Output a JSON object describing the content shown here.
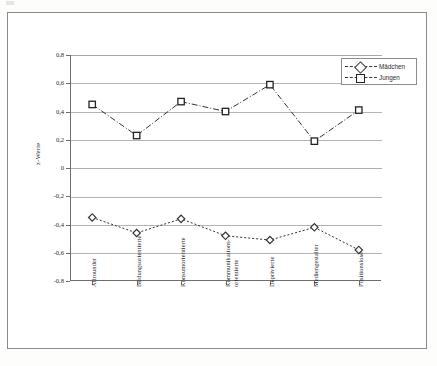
{
  "chart_data": {
    "type": "line",
    "title": "",
    "xlabel": "",
    "ylabel": "z-Werte",
    "ylim": [
      -0.8,
      0.8
    ],
    "ytick_labels": [
      "0,8",
      "0,6",
      "0,4",
      "0,2",
      "0",
      "-0,2",
      "-0,4",
      "-0,6",
      "-0,8"
    ],
    "ytick_values": [
      0.8,
      0.6,
      0.4,
      0.2,
      0,
      -0.2,
      -0.4,
      -0.6,
      -0.8
    ],
    "grid": true,
    "legend_position": "top-right",
    "categories": [
      "Allrounder",
      "Bildungsorientierte",
      "Konsumorientierte",
      "Kommunikations-orientierte",
      "Deprivierte",
      "Mediengestalter",
      "Positionslose"
    ],
    "category_lines": [
      [
        "Allrounder"
      ],
      [
        "Bildungsorientierte"
      ],
      [
        "Konsumorientierte"
      ],
      [
        "Kommunikations-",
        "orientierte"
      ],
      [
        "Deprivierte"
      ],
      [
        "Mediengestalter"
      ],
      [
        "Positionslose"
      ]
    ],
    "series": [
      {
        "name": "Mädchen",
        "marker": "diamond",
        "values": [
          -0.35,
          -0.46,
          -0.36,
          -0.48,
          -0.51,
          -0.42,
          -0.58
        ]
      },
      {
        "name": "Jungen",
        "marker": "square",
        "values": [
          0.45,
          0.23,
          0.47,
          0.4,
          0.59,
          0.19,
          0.41
        ]
      }
    ]
  },
  "legend": {
    "items": [
      {
        "label": "Mädchen",
        "marker": "diamond-marker"
      },
      {
        "label": "Jungen",
        "marker": "square-marker"
      }
    ]
  },
  "colors": {
    "line": "#333333",
    "grid": "#b4b4b4",
    "axis": "#6e6e6e",
    "frame": "#8a8a8a",
    "text": "#2b2b2b",
    "background": "#ffffff"
  }
}
